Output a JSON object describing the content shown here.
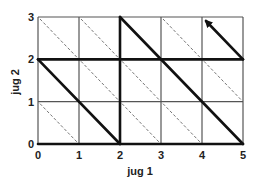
{
  "diagram": {
    "title": "",
    "x_axis": {
      "label": "jug 1",
      "ticks": [
        "0",
        "1",
        "2",
        "3",
        "4",
        "5"
      ],
      "range": [
        0,
        5
      ]
    },
    "y_axis": {
      "label": "jug 2",
      "ticks": [
        "0",
        "1",
        "2",
        "3"
      ],
      "range": [
        0,
        3
      ]
    },
    "grid": {
      "cols": 5,
      "rows": 3,
      "color": "#555555"
    },
    "dashed_diagonals": [
      [
        [
          0,
          3
        ],
        [
          1,
          2
        ]
      ],
      [
        [
          1,
          3
        ],
        [
          2,
          2
        ]
      ],
      [
        [
          3,
          3
        ],
        [
          4,
          2
        ]
      ],
      [
        [
          1,
          2
        ],
        [
          2,
          1
        ]
      ],
      [
        [
          2,
          2
        ],
        [
          3,
          1
        ]
      ],
      [
        [
          4,
          2
        ],
        [
          5,
          1
        ]
      ],
      [
        [
          0,
          1
        ],
        [
          1,
          0
        ]
      ],
      [
        [
          2,
          1
        ],
        [
          3,
          0
        ]
      ],
      [
        [
          3,
          1
        ],
        [
          4,
          0
        ]
      ]
    ],
    "bold_path": [
      [
        0,
        0
      ],
      [
        5,
        0
      ],
      [
        2,
        3
      ],
      [
        2,
        0
      ],
      [
        0,
        2
      ],
      [
        5,
        2
      ],
      [
        4,
        3
      ]
    ],
    "path_color": "#111111",
    "arrow_end": [
      4,
      3
    ]
  }
}
